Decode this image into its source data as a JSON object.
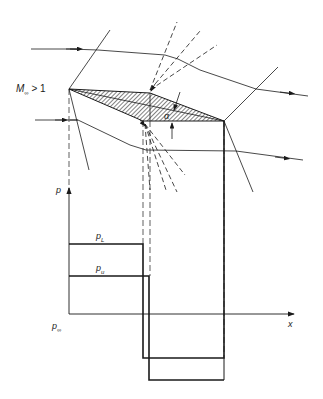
{
  "figure": {
    "mach_label": "M",
    "mach_sub": "∞",
    "mach_condition": "> 1",
    "alpha_label": "α",
    "p_axis_label": "p",
    "x_axis_label": "x",
    "p_lower_label": "p",
    "p_lower_sub": "L",
    "p_upper_label": "p",
    "p_upper_sub": "u",
    "p_inf_label": "p",
    "p_inf_sub": "∞"
  },
  "elements": {
    "airfoil": "diamond-airfoil-hatched",
    "shocks": [
      "leading-edge-shock-upper",
      "leading-edge-shock-lower",
      "trailing-edge-shock-upper",
      "trailing-edge-shock-lower"
    ],
    "expansion_fans": [
      "upper-expansion-fan",
      "lower-expansion-fan"
    ],
    "streamlines": [
      "upper-streamline",
      "lower-streamline"
    ]
  },
  "colors": {
    "line": "#1a1a1a",
    "background": "#ffffff"
  }
}
